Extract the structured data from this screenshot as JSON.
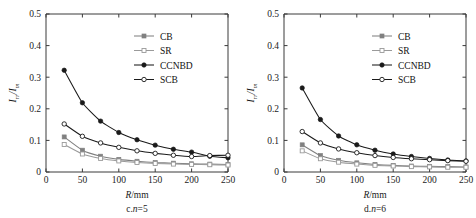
{
  "figure": {
    "panel_count": 2,
    "background": "#ffffff",
    "axis_color": "#3a3a3a",
    "series_colors": {
      "CB": "#808080",
      "SR": "#9a9a9a",
      "CCNBD": "#1a1a1a",
      "SCB": "#1a1a1a"
    }
  },
  "chart_data": [
    {
      "type": "line",
      "panel_id": "c",
      "title": "",
      "caption": "c.n=5",
      "caption_prefix": "c.",
      "caption_var": "n",
      "caption_suffix": "=5",
      "xlabel": "R/mm",
      "xlabel_var": "R",
      "xlabel_rest": "/mm",
      "ylabel": "Irr/Im",
      "ylabel_main": "I",
      "ylabel_sub1": "rr",
      "ylabel_slash": "/I",
      "ylabel_sub2": "m",
      "xlim": [
        0,
        250
      ],
      "ylim": [
        0,
        0.5
      ],
      "xticks": [
        0,
        50,
        100,
        150,
        200,
        250
      ],
      "xtick_labels": [
        "0",
        "50",
        "100",
        "150",
        "200",
        "250"
      ],
      "yticks": [
        0,
        0.1,
        0.2,
        0.3,
        0.4,
        0.5
      ],
      "ytick_labels": [
        "0",
        "0.1",
        "0.2",
        "0.3",
        "0.4",
        "0.5"
      ],
      "grid": false,
      "legend_position": "top-right",
      "x": [
        25,
        50,
        75,
        100,
        125,
        150,
        175,
        200,
        225,
        250
      ],
      "series": [
        {
          "name": "CB",
          "marker": "filled-square",
          "color": "#808080",
          "values": [
            0.111,
            0.069,
            0.05,
            0.04,
            0.034,
            0.03,
            0.028,
            0.026,
            0.025,
            0.024
          ]
        },
        {
          "name": "SR",
          "marker": "open-square",
          "color": "#9a9a9a",
          "values": [
            0.087,
            0.057,
            0.043,
            0.035,
            0.03,
            0.027,
            0.025,
            0.024,
            0.023,
            0.022
          ]
        },
        {
          "name": "CCNBD",
          "marker": "filled-circle",
          "color": "#1a1a1a",
          "values": [
            0.322,
            0.219,
            0.161,
            0.125,
            0.102,
            0.085,
            0.072,
            0.063,
            0.05,
            0.045
          ]
        },
        {
          "name": "SCB",
          "marker": "open-circle",
          "color": "#1a1a1a",
          "values": [
            0.152,
            0.113,
            0.092,
            0.078,
            0.067,
            0.059,
            0.053,
            0.049,
            0.052,
            0.053
          ]
        }
      ]
    },
    {
      "type": "line",
      "panel_id": "d",
      "title": "",
      "caption": "d.n=6",
      "caption_prefix": "d.",
      "caption_var": "n",
      "caption_suffix": "=6",
      "xlabel": "R/mm",
      "xlabel_var": "R",
      "xlabel_rest": "/mm",
      "ylabel": "Irr/Im",
      "ylabel_main": "I",
      "ylabel_sub1": "rr",
      "ylabel_slash": "/I",
      "ylabel_sub2": "m",
      "xlim": [
        0,
        250
      ],
      "ylim": [
        0,
        0.5
      ],
      "xticks": [
        0,
        50,
        100,
        150,
        200,
        250
      ],
      "xtick_labels": [
        "0",
        "50",
        "100",
        "150",
        "200",
        "250"
      ],
      "yticks": [
        0,
        0.1,
        0.2,
        0.3,
        0.4,
        0.5
      ],
      "ytick_labels": [
        "0",
        "0.1",
        "0.2",
        "0.3",
        "0.4",
        "0.5"
      ],
      "grid": false,
      "legend_position": "top-right",
      "x": [
        25,
        50,
        75,
        100,
        125,
        150,
        175,
        200,
        225,
        250
      ],
      "series": [
        {
          "name": "CB",
          "marker": "filled-square",
          "color": "#808080",
          "values": [
            0.086,
            0.052,
            0.037,
            0.029,
            0.024,
            0.021,
            0.019,
            0.018,
            0.017,
            0.016
          ]
        },
        {
          "name": "SR",
          "marker": "open-square",
          "color": "#9a9a9a",
          "values": [
            0.067,
            0.042,
            0.031,
            0.025,
            0.021,
            0.019,
            0.017,
            0.016,
            0.015,
            0.015
          ]
        },
        {
          "name": "CCNBD",
          "marker": "filled-circle",
          "color": "#1a1a1a",
          "values": [
            0.266,
            0.166,
            0.114,
            0.086,
            0.069,
            0.057,
            0.049,
            0.043,
            0.038,
            0.035
          ]
        },
        {
          "name": "SCB",
          "marker": "open-circle",
          "color": "#1a1a1a",
          "values": [
            0.128,
            0.092,
            0.073,
            0.061,
            0.052,
            0.046,
            0.042,
            0.039,
            0.036,
            0.034
          ]
        }
      ]
    }
  ]
}
